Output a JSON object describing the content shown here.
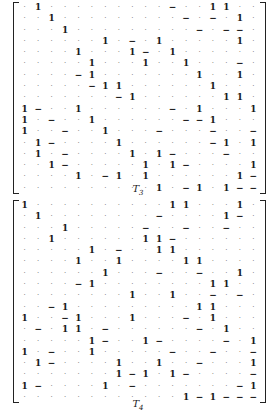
{
  "matrices": [
    {
      "label": "T",
      "subscript": "3",
      "rows": [
        ". 1 . . . . . . . . . − . . 1 1 . .",
        ". . 1 . . . . . . . . . − . − . 1 .",
        ". . . 1 . . . . . . . . . − . − − .",
        ". . . . . . 1 . − . 1 . . . . . 1 .",
        ". . . . 1 . . . 1 − . 1 . . . . . .",
        ". . . . . 1 . . . 1 . . 1 . . . − .",
        ". . . . − 1 . . . . . . . 1 . . 1 .",
        ". . . . . − 1 1 . . . . . . 1 . . .",
        ". . . . . . . − 1 . . . . . . 1 1 .",
        "1 − . . 1 . . . . . . − . 1 . . . 1",
        "1 . − . . 1 . . . . . . − − 1 . . .",
        "1 . . − . . 1 . . . − . . . − . . −",
        ". 1 − . . . . 1 . . . . . . − 1 . 1",
        ". 1 . − . . . . 1 . 1 − . . . − . .",
        ". . 1 − . . . . . 1 . 1 − . . . . 1",
        ". . . . 1 . − 1 . 1 . . . . . . 1 −",
        ". . . . . . . . . . 1 . − 1 . 1 − −"
      ]
    },
    {
      "label": "T",
      "subscript": "4",
      "rows": [
        "1 . . . . . . . . . . 1 1 . . . 1 .",
        ". 1 . . . . . . . . − . . . . 1 − .",
        ". . . 1 . . . . . − . . − . . − . .",
        ". . 1 . . . . . . 1 1 − . . . . . .",
        ". . . . . 1 . − . . 1 1 . . . . . .",
        ". . . . 1 . . 1 . . . . 1 1 . . . .",
        ". . . . . . 1 . . . − . . − . . 1 .",
        ". . . . − 1 . . . . . . . . 1 1 . .",
        ". . . . . . . . 1 . . 1 . . − . − .",
        ". . − 1 . . . . . . . . . 1 1 . . .",
        "1 . . − 1 . . . 1 . . . − . 1 . . .",
        ". − . 1 1 . − . . . . . . − . 1 . .",
        ". . . . . 1 − . . 1 − . . . . − . 1",
        "1 . − . . 1 . . . . . − . . − . . −",
        ". 1 − . . . . 1 . . 1 . . − . . . 1",
        ". . . . . . . 1 − 1 . 1 − . . . . −",
        "1 − . . . . 1 . − . . . . . . . − 1",
        ". . . . . . . . . . . . 1 − 1 − − −"
      ]
    }
  ]
}
